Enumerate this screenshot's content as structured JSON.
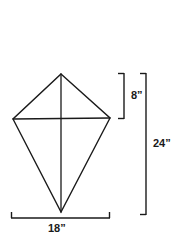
{
  "figure": {
    "type": "geometry-diagram",
    "shape_name": "kite",
    "background_color": "#ffffff",
    "stroke_color": "#1a1a1a",
    "text_color": "#1a1a1a"
  },
  "shape": {
    "name": "kite-outline",
    "vertices": {
      "top": [
        61,
        74
      ],
      "left": [
        13,
        119
      ],
      "right": [
        110,
        118
      ],
      "bottom": [
        61,
        212
      ]
    },
    "diagonals": {
      "vertical": [
        [
          61,
          74
        ],
        [
          61,
          212
        ]
      ],
      "horizontal": [
        [
          13,
          119
        ],
        [
          110,
          118
        ]
      ]
    }
  },
  "dimensions": [
    {
      "id": "upper-height",
      "label": "8”",
      "value": 8,
      "unit": "inches",
      "orientation": "vertical",
      "bracket": {
        "x": 124,
        "y_start": 73,
        "y_end": 119,
        "tick_direction": "left"
      },
      "describes": "distance from top vertex to horizontal diagonal"
    },
    {
      "id": "total-height",
      "label": "24”",
      "value": 24,
      "unit": "inches",
      "orientation": "vertical",
      "bracket": {
        "x": 146,
        "y_start": 73,
        "y_end": 215,
        "tick_direction": "left"
      },
      "describes": "distance from top vertex to bottom vertex"
    },
    {
      "id": "total-width",
      "label": "18”",
      "value": 18,
      "unit": "inches",
      "orientation": "horizontal",
      "bracket": {
        "y": 218,
        "x_start": 11,
        "x_end": 110,
        "tick_direction": "up"
      },
      "describes": "distance between left and right vertices"
    }
  ]
}
